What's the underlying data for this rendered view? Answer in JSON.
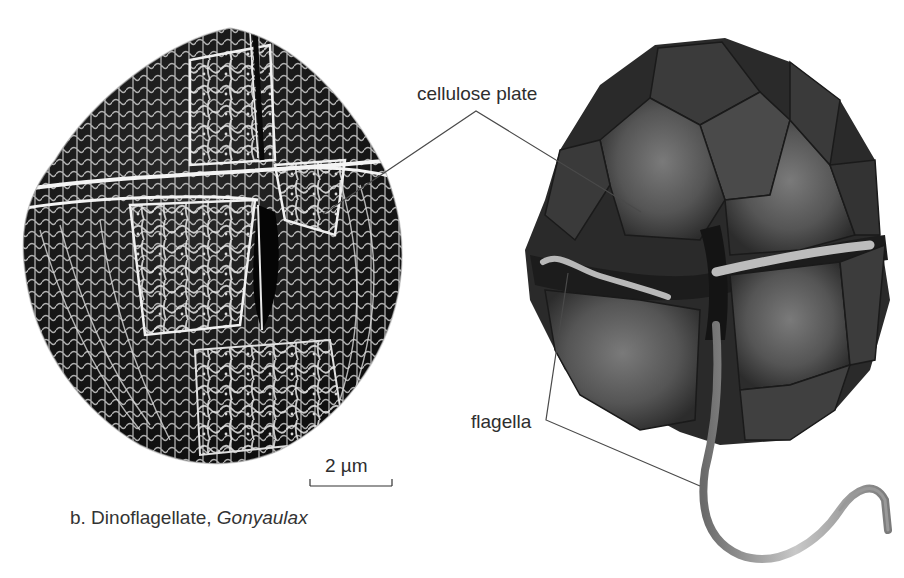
{
  "figure": {
    "panel_caption_prefix": "b. Dinoflagellate, ",
    "panel_caption_genus": "Gonyaulax",
    "scale_bar_label": "2 µm"
  },
  "labels": {
    "cellulose_plate": "cellulose plate",
    "flagella": "flagella"
  },
  "images": {
    "left": "scanning-electron-micrograph",
    "right": "illustrated-dinoflagellate-cell"
  },
  "colors": {
    "background": "#ffffff",
    "sem_dark": "#151515",
    "sem_ridge": "#e8e8e8",
    "plate_dark": "#2c2c2c",
    "plate_mid": "#5a5a5a",
    "plate_light": "#7a7a7a",
    "flagellum": "#a8a8a8",
    "leader_line": "#4a4a4a"
  }
}
